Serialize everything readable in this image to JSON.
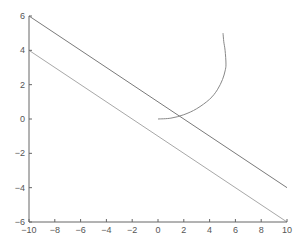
{
  "chart_data": {
    "type": "line",
    "title": "",
    "xlabel": "",
    "ylabel": "",
    "xlim": [
      -10,
      10
    ],
    "ylim": [
      -6,
      6
    ],
    "grid": false,
    "legend": null,
    "x_ticks": [
      -10,
      -8,
      -6,
      -4,
      -2,
      0,
      2,
      4,
      6,
      8,
      10
    ],
    "y_ticks": [
      -6,
      -4,
      -2,
      0,
      2,
      4,
      6
    ],
    "series": [
      {
        "name": "upper line",
        "color": "#7a7a7a",
        "x": [
          -10,
          10
        ],
        "y": [
          6,
          -4
        ]
      },
      {
        "name": "lower line",
        "color": "#a8a8a8",
        "x": [
          -10,
          10
        ],
        "y": [
          4,
          -6
        ]
      },
      {
        "name": "curve",
        "color": "#888888",
        "x": [
          0,
          1,
          2,
          3,
          4,
          4.6,
          5.0,
          5.2,
          5.27,
          5.2,
          5.1,
          5.04
        ],
        "y": [
          0,
          0.05,
          0.25,
          0.6,
          1.15,
          1.7,
          2.3,
          2.8,
          3.2,
          4.0,
          4.5,
          5.0
        ]
      }
    ]
  },
  "axes": {
    "x_tick_labels": [
      "−10",
      "−8",
      "−6",
      "−4",
      "−2",
      "0",
      "2",
      "4",
      "6",
      "8",
      "10"
    ],
    "y_tick_labels": [
      "−6",
      "−4",
      "−2",
      "0",
      "2",
      "4",
      "6"
    ]
  }
}
